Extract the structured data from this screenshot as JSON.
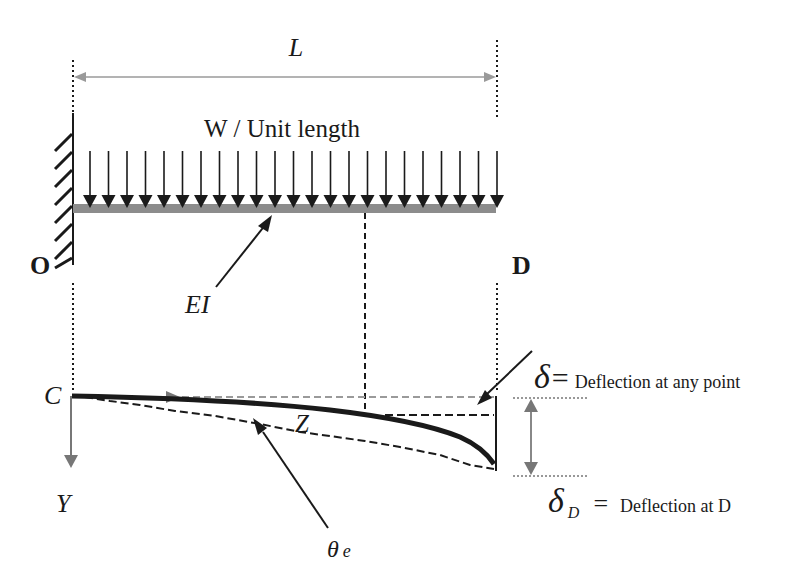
{
  "diagram": {
    "labels": {
      "span": "L",
      "load": "W / Unit length",
      "fixed_end": "O",
      "free_end": "D",
      "flexural_rigidity": "EI",
      "origin": "C",
      "y_axis": "Y",
      "point": "Z",
      "theta": "θ",
      "theta_sub": "e",
      "delta_symbol": "δ",
      "delta_eq": "=",
      "delta_desc": "Deflection at any point",
      "deltaD_symbol": "δ",
      "deltaD_sub": "D",
      "deltaD_eq": "=",
      "deltaD_desc": "Deflection at D"
    },
    "load_arrow_count": 23,
    "colors": {
      "beam": "#8c8c8c",
      "dimension": "#9a9a9a",
      "ink": "#1a1a1a",
      "axis": "#777777"
    }
  }
}
